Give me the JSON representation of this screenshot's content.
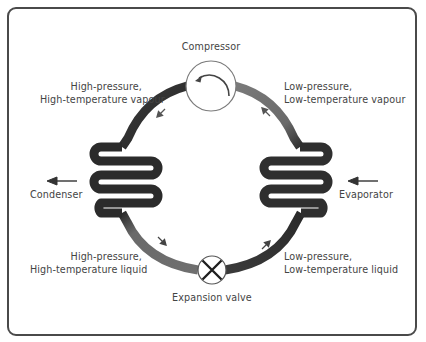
{
  "diagram": {
    "components": {
      "compressor": {
        "label": "Compressor",
        "icon": "rotation-arrow-icon"
      },
      "expansion_valve": {
        "label": "Expansion valve",
        "icon": "cross-valve-icon"
      },
      "condenser": {
        "label": "Condenser",
        "icon": "coil-icon",
        "heat_flow": "out (arrow pointing left)"
      },
      "evaporator": {
        "label": "Evaporator",
        "icon": "coil-icon",
        "heat_flow": "in (arrow pointing left)"
      }
    },
    "states": {
      "top_left": {
        "line1": "High-pressure,",
        "line2": "High-temperature vapour"
      },
      "top_right": {
        "line1": "Low-pressure,",
        "line2": "Low-temperature vapour"
      },
      "bottom_left": {
        "line1": "High-pressure,",
        "line2": "High-temperature liquid"
      },
      "bottom_right": {
        "line1": "Low-pressure,",
        "line2": "Low-temperature liquid"
      }
    },
    "colors": {
      "hot_pipe": "#2e2e2e",
      "cold_pipe": "#6f6f6f",
      "frame": "#4a4a4a",
      "text": "#444444"
    }
  }
}
